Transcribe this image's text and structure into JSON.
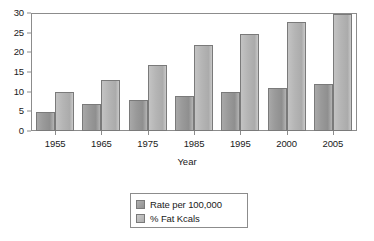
{
  "chart_data": {
    "type": "bar",
    "title": "",
    "xlabel": "Year",
    "ylabel": "",
    "categories": [
      "1955",
      "1965",
      "1975",
      "1985",
      "1995",
      "2000",
      "2005"
    ],
    "series": [
      {
        "name": "Rate per 100,000",
        "values": [
          5,
          7,
          8,
          9,
          10,
          11,
          12
        ],
        "color": "#9a9a9a"
      },
      {
        "name": "% Fat Kcals",
        "values": [
          10,
          13,
          17,
          22,
          25,
          28,
          30
        ],
        "color": "#b9b9b9"
      }
    ],
    "ylim": [
      0,
      30
    ],
    "yticks": [
      "0",
      "5",
      "10",
      "15",
      "20",
      "25",
      "30"
    ],
    "grid": false,
    "legend_position": "below-center",
    "frame": true
  },
  "colors": {
    "axis": "#8c8c8c",
    "bar_outline": "#7a7a7a",
    "text": "#1a1a1a",
    "background": "#ffffff"
  }
}
